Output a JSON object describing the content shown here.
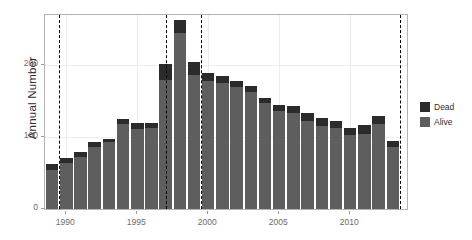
{
  "chart_data": {
    "type": "bar",
    "stacked": true,
    "title": "",
    "xlabel": "",
    "ylabel": "Annual Number",
    "xlim": [
      1988.5,
      2014.0
    ],
    "ylim": [
      0,
      270
    ],
    "grid": true,
    "legend_position": "right",
    "x_ticks": [
      1990,
      1995,
      2000,
      2005,
      2010
    ],
    "x_tick_labels": [
      "1990",
      "1995",
      "2000",
      "2005",
      "2010"
    ],
    "y_ticks": [
      0,
      100,
      200
    ],
    "y_tick_labels": [
      "0",
      "100",
      "200"
    ],
    "categories": [
      1989,
      1990,
      1991,
      1992,
      1993,
      1994,
      1995,
      1996,
      1997,
      1998,
      1999,
      2000,
      2001,
      2002,
      2003,
      2004,
      2005,
      2006,
      2007,
      2008,
      2009,
      2010,
      2011,
      2012,
      2013
    ],
    "series": [
      {
        "name": "Alive",
        "color": "#5e5e5e",
        "values": [
          54,
          64,
          72,
          86,
          93,
          118,
          112,
          113,
          180,
          245,
          186,
          178,
          175,
          170,
          163,
          147,
          137,
          134,
          122,
          115,
          113,
          103,
          104,
          118,
          86
        ]
      },
      {
        "name": "Dead",
        "color": "#2b2b2b",
        "values": [
          8,
          7,
          7,
          7,
          5,
          7,
          8,
          7,
          22,
          18,
          18,
          12,
          10,
          8,
          8,
          8,
          8,
          9,
          12,
          11,
          9,
          10,
          13,
          11,
          9
        ]
      }
    ],
    "totals": [
      62,
      71,
      79,
      93,
      98,
      125,
      120,
      120,
      202,
      263,
      204,
      190,
      185,
      178,
      171,
      155,
      145,
      143,
      134,
      126,
      122,
      113,
      117,
      129,
      95
    ],
    "reference_lines": [
      {
        "x": 1989.5,
        "style": "dashed",
        "color": "#000000"
      },
      {
        "x": 1997.0,
        "style": "dashed",
        "color": "#000000"
      },
      {
        "x": 1999.5,
        "style": "dashed",
        "color": "#000000"
      },
      {
        "x": 2013.5,
        "style": "dashed",
        "color": "#000000"
      }
    ]
  },
  "legend": {
    "items": [
      {
        "label": "Dead",
        "color": "#2b2b2b"
      },
      {
        "label": "Alive",
        "color": "#5e5e5e"
      }
    ]
  }
}
